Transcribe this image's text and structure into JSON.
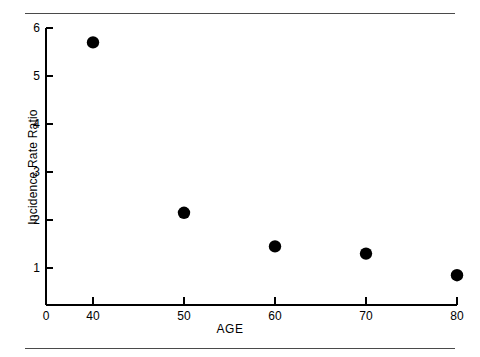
{
  "figure": {
    "background_color": "#ffffff",
    "foreground_color": "#000000",
    "rule_color": "#4a4a4a",
    "top_rule": "",
    "bottom_rule": ""
  },
  "chart_data": {
    "type": "scatter",
    "title": "",
    "xlabel": "AGE",
    "ylabel": "Incidence Rate Ratio",
    "x": [
      40,
      50,
      60,
      70,
      80
    ],
    "values": [
      5.7,
      2.15,
      1.45,
      1.3,
      0.85
    ],
    "series": [
      {
        "name": "Incidence Rate Ratio",
        "x": [
          40,
          50,
          60,
          70,
          80
        ],
        "values": [
          5.7,
          2.15,
          1.45,
          1.3,
          0.85
        ],
        "marker": "filled-circle",
        "marker_color": "#000000"
      }
    ],
    "xlim": [
      0,
      80
    ],
    "ylim": [
      0.23,
      6.2
    ],
    "xticks": [
      0,
      40,
      50,
      60,
      70,
      80
    ],
    "xtick_labels": [
      "0",
      "40",
      "50",
      "60",
      "70",
      "80"
    ],
    "yticks": [
      1,
      2,
      3,
      4,
      5,
      6
    ],
    "ytick_labels": [
      "1",
      "2",
      "3",
      "4",
      "5",
      "6"
    ],
    "grid": false,
    "legend": false,
    "legend_position": "none"
  },
  "axes": {
    "x_title": "AGE",
    "y_title": "Incidence Rate Ratio",
    "x_tick_labels": [
      "0",
      "40",
      "50",
      "60",
      "70",
      "80"
    ],
    "y_tick_labels": [
      "1",
      "2",
      "3",
      "4",
      "5",
      "6"
    ]
  },
  "geometry": {
    "x_pixels": [
      46,
      93,
      184,
      275,
      366,
      457
    ],
    "y_baseline_px": 305,
    "y_axis_px": 46,
    "y_unit_px": 48,
    "y_one_px": 268,
    "point_radius_px": 6.2
  }
}
